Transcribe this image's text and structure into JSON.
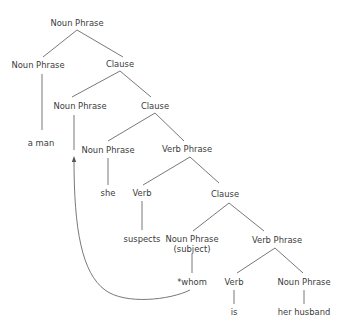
{
  "diagram": {
    "type": "syntax-tree",
    "nodes": [
      {
        "id": "np_root",
        "label": "Noun Phrase",
        "x": 77,
        "y": 23
      },
      {
        "id": "np_head",
        "label": "Noun Phrase",
        "x": 38,
        "y": 65
      },
      {
        "id": "clause_1",
        "label": "Clause",
        "x": 120,
        "y": 64
      },
      {
        "id": "np_gap",
        "label": "Noun Phrase",
        "x": 80,
        "y": 106
      },
      {
        "id": "clause_2",
        "label": "Clause",
        "x": 155,
        "y": 106
      },
      {
        "id": "a_man",
        "label": "a man",
        "x": 41,
        "y": 143
      },
      {
        "id": "np_she",
        "label": "Noun Phrase",
        "x": 108,
        "y": 150
      },
      {
        "id": "vp_1",
        "label": "Verb Phrase",
        "x": 187,
        "y": 149
      },
      {
        "id": "she",
        "label": "she",
        "x": 108,
        "y": 193
      },
      {
        "id": "verb_1",
        "label": "Verb",
        "x": 142,
        "y": 193
      },
      {
        "id": "clause_3",
        "label": "Clause",
        "x": 225,
        "y": 194
      },
      {
        "id": "suspects",
        "label": "suspects",
        "x": 142,
        "y": 239
      },
      {
        "id": "np_subject",
        "label": "Noun Phrase",
        "sublabel": "(subject)",
        "x": 192,
        "y": 244
      },
      {
        "id": "vp_2",
        "label": "Verb Phrase",
        "x": 277,
        "y": 240
      },
      {
        "id": "whom",
        "label": "*whom",
        "x": 192,
        "y": 282
      },
      {
        "id": "verb_2",
        "label": "Verb",
        "x": 234,
        "y": 282
      },
      {
        "id": "np_husband",
        "label": "Noun Phrase",
        "x": 304,
        "y": 282
      },
      {
        "id": "is",
        "label": "is",
        "x": 234,
        "y": 312
      },
      {
        "id": "her_husband",
        "label": "her husband",
        "x": 304,
        "y": 312
      }
    ],
    "edges": [
      {
        "from": "np_root",
        "to": "np_head",
        "x1": 77,
        "y1": 30,
        "x2": 43,
        "y2": 57
      },
      {
        "from": "np_root",
        "to": "clause_1",
        "x1": 77,
        "y1": 30,
        "x2": 123,
        "y2": 57
      },
      {
        "from": "np_head",
        "to": "a_man",
        "x1": 42,
        "y1": 74,
        "x2": 42,
        "y2": 130
      },
      {
        "from": "clause_1",
        "to": "np_gap",
        "x1": 120,
        "y1": 71,
        "x2": 72,
        "y2": 97
      },
      {
        "from": "clause_1",
        "to": "clause_2",
        "x1": 120,
        "y1": 71,
        "x2": 151,
        "y2": 97
      },
      {
        "from": "np_gap",
        "to": "trace",
        "x1": 74,
        "y1": 115,
        "x2": 74,
        "y2": 150
      },
      {
        "from": "clause_2",
        "to": "np_she",
        "x1": 155,
        "y1": 113,
        "x2": 108,
        "y2": 141
      },
      {
        "from": "clause_2",
        "to": "vp_1",
        "x1": 155,
        "y1": 113,
        "x2": 184,
        "y2": 141
      },
      {
        "from": "np_she",
        "to": "she",
        "x1": 108,
        "y1": 158,
        "x2": 108,
        "y2": 185
      },
      {
        "from": "vp_1",
        "to": "verb_1",
        "x1": 190,
        "y1": 157,
        "x2": 143,
        "y2": 185
      },
      {
        "from": "vp_1",
        "to": "clause_3",
        "x1": 190,
        "y1": 157,
        "x2": 219,
        "y2": 183
      },
      {
        "from": "verb_1",
        "to": "suspects",
        "x1": 142,
        "y1": 201,
        "x2": 142,
        "y2": 230
      },
      {
        "from": "clause_3",
        "to": "np_subject",
        "x1": 229,
        "y1": 203,
        "x2": 193,
        "y2": 231
      },
      {
        "from": "clause_3",
        "to": "vp_2",
        "x1": 229,
        "y1": 203,
        "x2": 264,
        "y2": 231
      },
      {
        "from": "np_subject",
        "to": "whom",
        "x1": 192,
        "y1": 254,
        "x2": 192,
        "y2": 273
      },
      {
        "from": "vp_2",
        "to": "verb_2",
        "x1": 275,
        "y1": 248,
        "x2": 237,
        "y2": 273
      },
      {
        "from": "vp_2",
        "to": "np_husband",
        "x1": 275,
        "y1": 248,
        "x2": 303,
        "y2": 273
      },
      {
        "from": "verb_2",
        "to": "is",
        "x1": 234,
        "y1": 290,
        "x2": 234,
        "y2": 304
      },
      {
        "from": "np_husband",
        "to": "her_husband",
        "x1": 304,
        "y1": 290,
        "x2": 304,
        "y2": 304
      }
    ],
    "movement_arrow": {
      "from": "whom",
      "to": "np_gap",
      "path": "M 190 290 C 170 300, 125 305, 105 290 C 82 273, 74 230, 74 160",
      "arrowhead": {
        "x": 74,
        "y": 157
      }
    },
    "colors": {
      "line": "#555555",
      "text": "#3a3a3a",
      "background": "#ffffff"
    }
  }
}
